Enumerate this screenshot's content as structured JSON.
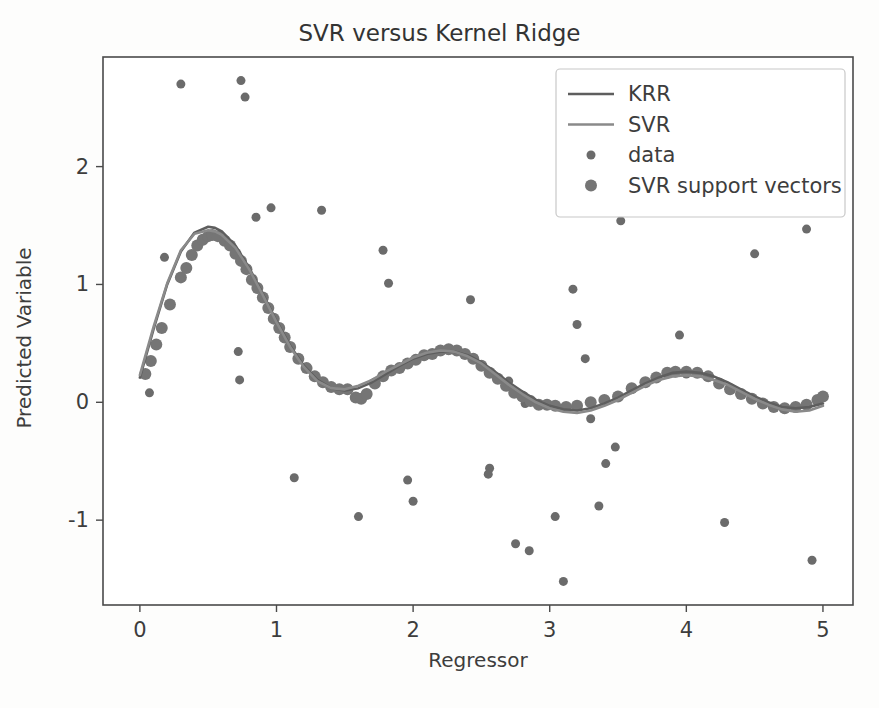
{
  "figure": {
    "background_color": "#fdfdfc",
    "width": 879,
    "height": 708
  },
  "chart_data": {
    "type": "scatter",
    "title": "SVR versus Kernel Ridge",
    "xlabel": "Regressor",
    "ylabel": "Predicted Variable",
    "xlim": [
      -0.27,
      5.22
    ],
    "ylim": [
      -1.72,
      2.93
    ],
    "xticks": [
      0,
      1,
      2,
      3,
      4,
      5
    ],
    "xtick_labels": [
      "0",
      "1",
      "2",
      "3",
      "4",
      "5"
    ],
    "yticks": [
      -1,
      0,
      1,
      2
    ],
    "ytick_labels": [
      "-1",
      "0",
      "1",
      "2"
    ],
    "grid": false,
    "legend_position": "upper right",
    "colors": {
      "krr_line": "#5e5e5e",
      "svr_line": "#8a8a8a",
      "data_marker": "#6b6b6b",
      "support_vector_marker": "#757575",
      "axis": "#4a4a4a",
      "text": "#3d3d3d"
    },
    "legend": [
      {
        "label": "KRR",
        "type": "line",
        "color": "#5e5e5e"
      },
      {
        "label": "SVR",
        "type": "line",
        "color": "#8a8a8a"
      },
      {
        "label": "data",
        "type": "marker",
        "color": "#6b6b6b",
        "size": 9
      },
      {
        "label": "SVR support vectors",
        "type": "marker",
        "color": "#757575",
        "size": 12
      }
    ],
    "series": [
      {
        "name": "KRR",
        "type": "line",
        "color": "#5e5e5e",
        "linewidth": 2.6,
        "x": [
          0.0,
          0.1,
          0.2,
          0.3,
          0.4,
          0.5,
          0.55,
          0.6,
          0.7,
          0.8,
          0.9,
          1.0,
          1.1,
          1.2,
          1.3,
          1.4,
          1.5,
          1.6,
          1.7,
          1.8,
          1.9,
          2.0,
          2.1,
          2.2,
          2.3,
          2.4,
          2.5,
          2.6,
          2.7,
          2.8,
          2.9,
          3.0,
          3.1,
          3.2,
          3.3,
          3.4,
          3.5,
          3.6,
          3.7,
          3.8,
          3.9,
          4.0,
          4.1,
          4.2,
          4.3,
          4.4,
          4.5,
          4.6,
          4.7,
          4.8,
          4.9,
          5.0
        ],
        "y": [
          0.21,
          0.62,
          1.0,
          1.28,
          1.44,
          1.49,
          1.48,
          1.45,
          1.33,
          1.14,
          0.92,
          0.69,
          0.48,
          0.31,
          0.19,
          0.12,
          0.1,
          0.12,
          0.17,
          0.24,
          0.31,
          0.37,
          0.41,
          0.43,
          0.43,
          0.4,
          0.34,
          0.26,
          0.17,
          0.09,
          0.02,
          -0.03,
          -0.06,
          -0.07,
          -0.05,
          -0.01,
          0.04,
          0.1,
          0.16,
          0.21,
          0.25,
          0.26,
          0.25,
          0.22,
          0.17,
          0.11,
          0.05,
          0.0,
          -0.04,
          -0.05,
          -0.04,
          -0.01
        ]
      },
      {
        "name": "SVR",
        "type": "line",
        "color": "#8a8a8a",
        "linewidth": 2.6,
        "x": [
          0.0,
          0.1,
          0.2,
          0.3,
          0.4,
          0.5,
          0.55,
          0.6,
          0.7,
          0.8,
          0.9,
          1.0,
          1.1,
          1.2,
          1.3,
          1.4,
          1.5,
          1.6,
          1.7,
          1.8,
          1.9,
          2.0,
          2.1,
          2.2,
          2.3,
          2.4,
          2.5,
          2.6,
          2.7,
          2.8,
          2.9,
          3.0,
          3.1,
          3.2,
          3.3,
          3.4,
          3.5,
          3.6,
          3.7,
          3.8,
          3.9,
          4.0,
          4.1,
          4.2,
          4.3,
          4.4,
          4.5,
          4.6,
          4.7,
          4.8,
          4.9,
          5.0
        ],
        "y": [
          0.23,
          0.64,
          1.01,
          1.29,
          1.43,
          1.46,
          1.45,
          1.42,
          1.31,
          1.13,
          0.91,
          0.68,
          0.47,
          0.3,
          0.18,
          0.12,
          0.11,
          0.14,
          0.19,
          0.26,
          0.32,
          0.38,
          0.42,
          0.44,
          0.43,
          0.39,
          0.33,
          0.24,
          0.15,
          0.07,
          0.0,
          -0.05,
          -0.08,
          -0.09,
          -0.07,
          -0.03,
          0.02,
          0.08,
          0.14,
          0.19,
          0.22,
          0.23,
          0.22,
          0.19,
          0.15,
          0.09,
          0.03,
          -0.02,
          -0.06,
          -0.08,
          -0.07,
          -0.03
        ]
      },
      {
        "name": "data",
        "type": "scatter",
        "color": "#6b6b6b",
        "marker_size": 9,
        "points": [
          [
            0.07,
            0.08
          ],
          [
            0.18,
            1.23
          ],
          [
            0.3,
            2.7
          ],
          [
            0.74,
            2.73
          ],
          [
            0.77,
            2.59
          ],
          [
            0.72,
            0.43
          ],
          [
            0.73,
            0.19
          ],
          [
            0.85,
            1.57
          ],
          [
            0.96,
            1.65
          ],
          [
            1.13,
            -0.64
          ],
          [
            1.33,
            1.63
          ],
          [
            1.6,
            -0.97
          ],
          [
            1.78,
            1.29
          ],
          [
            1.82,
            1.01
          ],
          [
            1.96,
            -0.66
          ],
          [
            2.0,
            -0.84
          ],
          [
            2.42,
            0.87
          ],
          [
            2.56,
            -0.56
          ],
          [
            2.55,
            -0.61
          ],
          [
            2.7,
            0.18
          ],
          [
            2.75,
            -1.2
          ],
          [
            2.85,
            -1.26
          ],
          [
            2.82,
            -0.01
          ],
          [
            3.1,
            -1.52
          ],
          [
            3.04,
            -0.97
          ],
          [
            3.17,
            0.96
          ],
          [
            3.2,
            0.66
          ],
          [
            3.26,
            0.37
          ],
          [
            3.3,
            -0.14
          ],
          [
            3.41,
            -0.52
          ],
          [
            3.36,
            -0.88
          ],
          [
            3.48,
            -0.38
          ],
          [
            3.52,
            1.54
          ],
          [
            3.95,
            0.57
          ],
          [
            4.0,
            0.24
          ],
          [
            4.28,
            -1.02
          ],
          [
            4.5,
            1.26
          ],
          [
            4.88,
            1.47
          ],
          [
            4.92,
            -1.34
          ]
        ]
      },
      {
        "name": "SVR support vectors",
        "type": "scatter",
        "color": "#757575",
        "marker_size": 12,
        "points": [
          [
            0.04,
            0.24
          ],
          [
            0.08,
            0.35
          ],
          [
            0.12,
            0.49
          ],
          [
            0.16,
            0.63
          ],
          [
            0.22,
            0.83
          ],
          [
            0.3,
            1.06
          ],
          [
            0.34,
            1.14
          ],
          [
            0.38,
            1.25
          ],
          [
            0.42,
            1.33
          ],
          [
            0.46,
            1.38
          ],
          [
            0.5,
            1.41
          ],
          [
            0.53,
            1.42
          ],
          [
            0.57,
            1.41
          ],
          [
            0.62,
            1.37
          ],
          [
            0.66,
            1.33
          ],
          [
            0.7,
            1.26
          ],
          [
            0.74,
            1.2
          ],
          [
            0.78,
            1.13
          ],
          [
            0.82,
            1.04
          ],
          [
            0.86,
            0.97
          ],
          [
            0.9,
            0.89
          ],
          [
            0.94,
            0.8
          ],
          [
            0.98,
            0.71
          ],
          [
            1.02,
            0.63
          ],
          [
            1.06,
            0.55
          ],
          [
            1.1,
            0.47
          ],
          [
            1.16,
            0.37
          ],
          [
            1.22,
            0.29
          ],
          [
            1.28,
            0.22
          ],
          [
            1.34,
            0.17
          ],
          [
            1.4,
            0.13
          ],
          [
            1.46,
            0.11
          ],
          [
            1.52,
            0.11
          ],
          [
            1.58,
            0.04
          ],
          [
            1.62,
            0.03
          ],
          [
            1.66,
            0.07
          ],
          [
            1.72,
            0.16
          ],
          [
            1.78,
            0.22
          ],
          [
            1.84,
            0.27
          ],
          [
            1.9,
            0.29
          ],
          [
            1.96,
            0.33
          ],
          [
            2.02,
            0.36
          ],
          [
            2.08,
            0.4
          ],
          [
            2.14,
            0.41
          ],
          [
            2.2,
            0.44
          ],
          [
            2.26,
            0.45
          ],
          [
            2.32,
            0.44
          ],
          [
            2.38,
            0.41
          ],
          [
            2.44,
            0.37
          ],
          [
            2.5,
            0.31
          ],
          [
            2.56,
            0.25
          ],
          [
            2.62,
            0.2
          ],
          [
            2.68,
            0.14
          ],
          [
            2.74,
            0.08
          ],
          [
            2.8,
            0.05
          ],
          [
            2.86,
            0.01
          ],
          [
            2.92,
            -0.02
          ],
          [
            2.98,
            -0.02
          ],
          [
            3.04,
            -0.03
          ],
          [
            3.12,
            -0.04
          ],
          [
            3.2,
            -0.03
          ],
          [
            3.3,
            0.0
          ],
          [
            3.4,
            0.02
          ],
          [
            3.5,
            0.05
          ],
          [
            3.6,
            0.12
          ],
          [
            3.7,
            0.17
          ],
          [
            3.78,
            0.21
          ],
          [
            3.86,
            0.25
          ],
          [
            3.92,
            0.26
          ],
          [
            4.0,
            0.26
          ],
          [
            4.08,
            0.25
          ],
          [
            4.16,
            0.22
          ],
          [
            4.24,
            0.16
          ],
          [
            4.32,
            0.11
          ],
          [
            4.4,
            0.07
          ],
          [
            4.48,
            0.03
          ],
          [
            4.56,
            -0.01
          ],
          [
            4.64,
            -0.04
          ],
          [
            4.72,
            -0.05
          ],
          [
            4.8,
            -0.04
          ],
          [
            4.88,
            -0.02
          ],
          [
            4.96,
            0.02
          ],
          [
            5.0,
            0.05
          ]
        ]
      }
    ]
  }
}
